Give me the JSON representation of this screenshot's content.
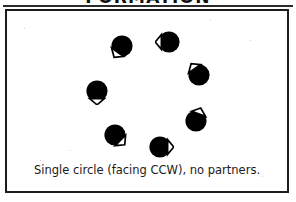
{
  "figure": {
    "title": "FORMATION",
    "caption": "Single circle (facing CCW), no partners.",
    "colors": {
      "ink": "#1c1c1c",
      "body_fill": "#000000",
      "nose_fill": "#ffffff",
      "page": "#ffffff"
    },
    "frame": {
      "label": "figure-border"
    },
    "diagram": {
      "name": "single-circle-formation",
      "dancer_count": 7,
      "facing": "CCW",
      "partners": "none",
      "icon_name": "dancer-circle-icon",
      "dancers": [
        {
          "id": 1,
          "label": "dancer-1",
          "x": 115,
          "y": 35,
          "nose_angle": 215
        },
        {
          "id": 2,
          "label": "dancer-2",
          "x": 162,
          "y": 31,
          "nose_angle": 270
        },
        {
          "id": 3,
          "label": "dancer-3",
          "x": 192,
          "y": 64,
          "nose_angle": 325
        },
        {
          "id": 4,
          "label": "dancer-4",
          "x": 189,
          "y": 110,
          "nose_angle": 20
        },
        {
          "id": 5,
          "label": "dancer-5",
          "x": 153,
          "y": 136,
          "nose_angle": 90
        },
        {
          "id": 6,
          "label": "dancer-6",
          "x": 108,
          "y": 124,
          "nose_angle": 135
        },
        {
          "id": 7,
          "label": "dancer-7",
          "x": 90,
          "y": 80,
          "nose_angle": 180
        }
      ]
    }
  }
}
